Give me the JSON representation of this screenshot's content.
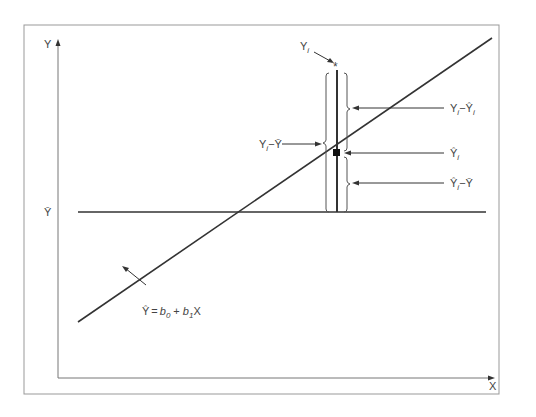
{
  "diagram": {
    "axes": {
      "x_label": "X",
      "y_label": "Y",
      "y_mean_label": "Ȳ"
    },
    "regression_equation": {
      "yhat": "Ŷ",
      "eq": "=",
      "b": "b",
      "sub0": "0",
      "plus": "+",
      "sub1": "1",
      "x": "X"
    },
    "labels": {
      "yi_main": "Y",
      "yi_sub": "i",
      "total_dev_a": "Y",
      "total_dev_sub": "i",
      "total_dev_b": "−Ȳ",
      "resid_a": "Y",
      "resid_sub1": "i",
      "resid_b": "−Ŷ",
      "resid_sub2": "i",
      "yhat_i_main": "Ŷ",
      "yhat_i_sub": "i",
      "explained_a": "Ŷ",
      "explained_sub": "i",
      "explained_b": "−Ȳ"
    },
    "observed_point_marker": "*",
    "colors": {
      "line": "#333333",
      "frame": "#888888",
      "text": "#444444"
    }
  }
}
